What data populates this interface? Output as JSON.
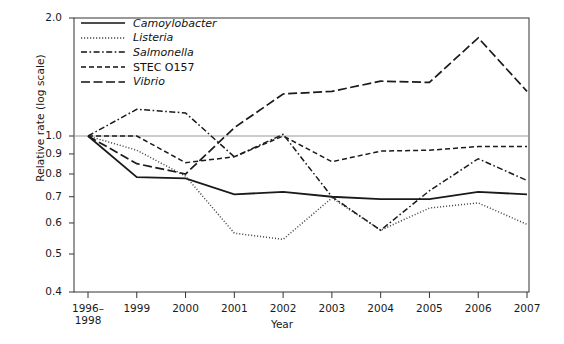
{
  "chart_data": {
    "type": "line",
    "title": "",
    "xlabel": "Year",
    "ylabel": "Relative rate (log scale)",
    "scale": "log",
    "grid": false,
    "reference_line": 1.0,
    "legend_position": "top-left",
    "categories": [
      "1996–1998",
      "1999",
      "2000",
      "2001",
      "2002",
      "2003",
      "2004",
      "2005",
      "2006",
      "2007"
    ],
    "x_tick_labels": [
      "1996–\n1998",
      "1999",
      "2000",
      "2001",
      "2002",
      "2003",
      "2004",
      "2005",
      "2006",
      "2007"
    ],
    "y_tick_labels": [
      "2.0",
      "1.0",
      "0.9",
      "0.8",
      "0.7",
      "0.6",
      "0.5",
      "0.4"
    ],
    "y_ticks": [
      2.0,
      1.0,
      0.9,
      0.8,
      0.7,
      0.6,
      0.5,
      0.4
    ],
    "ylim": [
      0.4,
      2.0
    ],
    "series": [
      {
        "name": "Camoylobacter",
        "italic": true,
        "dash": "solid",
        "color": "#1a1a1a",
        "values": [
          1.0,
          0.785,
          0.78,
          0.71,
          0.72,
          0.7,
          0.69,
          0.69,
          0.72,
          0.71
        ]
      },
      {
        "name": "Listeria",
        "italic": true,
        "dash": "dotted",
        "color": "#4d4d4d",
        "values": [
          1.0,
          0.92,
          0.79,
          0.565,
          0.545,
          0.695,
          0.575,
          0.655,
          0.675,
          0.595
        ]
      },
      {
        "name": "Salmonella",
        "italic": true,
        "dash": "dashdot",
        "color": "#1a1a1a",
        "values": [
          1.0,
          1.17,
          1.145,
          0.885,
          1.01,
          0.7,
          0.575,
          0.725,
          0.875,
          0.77
        ]
      },
      {
        "name": "STEC O157",
        "italic": false,
        "dash": "dashed-short",
        "color": "#1a1a1a",
        "values": [
          1.0,
          1.0,
          0.855,
          0.885,
          1.0,
          0.86,
          0.915,
          0.92,
          0.94,
          0.94
        ]
      },
      {
        "name": "Vibrio",
        "italic": true,
        "dash": "dashed-long",
        "color": "#1a1a1a",
        "values": [
          1.0,
          0.85,
          0.8,
          1.05,
          1.28,
          1.3,
          1.38,
          1.37,
          1.78,
          1.3
        ]
      }
    ]
  },
  "legend": {
    "items": [
      {
        "label": "Camoylobacter"
      },
      {
        "label": "Listeria"
      },
      {
        "label": "Salmonella"
      },
      {
        "label": "STEC O157"
      },
      {
        "label": "Vibrio"
      }
    ]
  },
  "axes": {
    "x_title": "Year",
    "y_title": "Relative rate (log scale)"
  }
}
